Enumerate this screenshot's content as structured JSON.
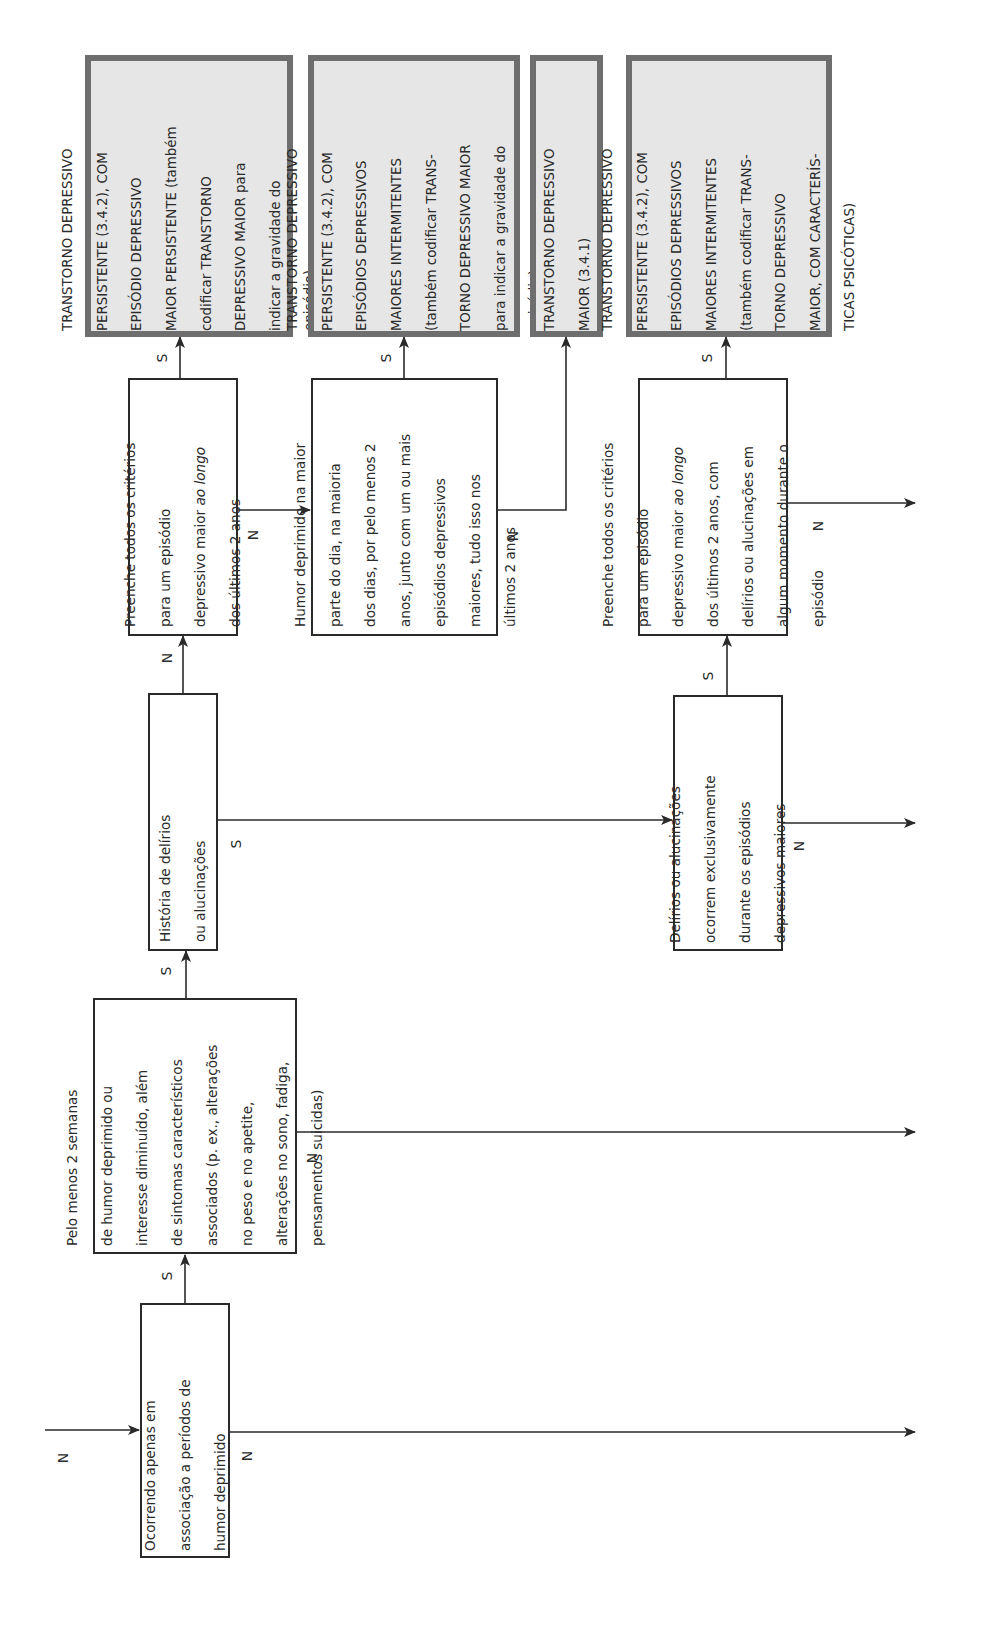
{
  "diagram": {
    "type": "decision-tree",
    "orientation": "rotated-90-ccw",
    "decision_nodes": [
      {
        "id": "n1",
        "lines": [
          "Ocorrendo apenas em",
          "associação a períodos de",
          "humor deprimido"
        ]
      },
      {
        "id": "n2",
        "lines": [
          "Pelo menos 2 semanas",
          "de humor deprimido ou",
          "interesse diminuído, além",
          "de sintomas característicos",
          "associados (p. ex., alterações",
          "no peso e no apetite,",
          "alterações no sono, fadiga,",
          "pensamentos suicidas)"
        ]
      },
      {
        "id": "n3",
        "lines": [
          "História de delírios",
          "ou alucinações"
        ]
      },
      {
        "id": "n4",
        "lines": [
          "Preenche todos os critérios",
          "para um episódio",
          "depressivo maior ao longo",
          "dos últimos 2 anos"
        ],
        "italic_phrase": "ao longo"
      },
      {
        "id": "n5",
        "lines": [
          "Humor deprimido na maior",
          "parte do dia, na maioria",
          "dos dias, por pelo menos 2",
          "anos, junto com um ou mais",
          "episódios depressivos",
          "maiores, tudo isso nos",
          "últimos 2 anos"
        ]
      },
      {
        "id": "n6",
        "lines": [
          "Delírios ou alucinações",
          "ocorrem exclusivamente",
          "durante os episódios",
          "depressivos maiores"
        ]
      },
      {
        "id": "n7",
        "lines": [
          "Preenche todos os critérios",
          "para um episódio",
          "depressivo maior ao longo",
          "dos últimos 2 anos, com",
          "delírios ou alucinações em",
          "algum momento durante o",
          "episódio"
        ],
        "italic_phrase": "ao longo"
      }
    ],
    "result_nodes": [
      {
        "id": "r1",
        "lines": [
          "TRANSTORNO DEPRESSIVO",
          "PERSISTENTE (3.4.2), COM",
          "EPISÓDIO DEPRESSIVO",
          "MAIOR PERSISTENTE (também",
          "codificar TRANSTORNO",
          "DEPRESSIVO MAIOR para",
          "indicar a gravidade do",
          "episódio)"
        ]
      },
      {
        "id": "r2",
        "lines": [
          "TRANSTORNO DEPRESSIVO",
          "PERSISTENTE (3.4.2), COM",
          "EPISÓDIOS DEPRESSIVOS",
          "MAIORES INTERMITENTES",
          "(também codificar TRANS-",
          "TORNO DEPRESSIVO MAIOR",
          "para indicar a gravidade do",
          "episódio)"
        ]
      },
      {
        "id": "r3",
        "lines": [
          "TRANSTORNO DEPRESSIVO",
          "MAIOR (3.4.1)"
        ]
      },
      {
        "id": "r4",
        "lines": [
          "TRANSTORNO DEPRESSIVO",
          "PERSISTENTE (3.4.2), COM",
          "EPISÓDIOS DEPRESSIVOS",
          "MAIORES INTERMITENTES",
          "(também codificar TRANS-",
          "TORNO DEPRESSIVO",
          "MAIOR, COM CARACTERÍS-",
          "TICAS PSICÓTICAS)"
        ]
      }
    ],
    "edge_labels": {
      "yes": "S",
      "no": "N"
    },
    "edges": [
      {
        "from": "entry",
        "to": "n1",
        "label": "N"
      },
      {
        "from": "n1",
        "to": "n2",
        "label": "S"
      },
      {
        "from": "n1",
        "to": "exit",
        "label": "N"
      },
      {
        "from": "n2",
        "to": "n3",
        "label": "S"
      },
      {
        "from": "n2",
        "to": "exit",
        "label": "N"
      },
      {
        "from": "n3",
        "to": "n4",
        "label": "N"
      },
      {
        "from": "n3",
        "to": "n6",
        "label": "S"
      },
      {
        "from": "n4",
        "to": "r1",
        "label": "S"
      },
      {
        "from": "n4",
        "to": "n5",
        "label": "N"
      },
      {
        "from": "n5",
        "to": "r2",
        "label": "S"
      },
      {
        "from": "n5",
        "to": "r3",
        "label": "N"
      },
      {
        "from": "n6",
        "to": "n7",
        "label": "S"
      },
      {
        "from": "n6",
        "to": "exit",
        "label": "N"
      },
      {
        "from": "n7",
        "to": "r4",
        "label": "S"
      },
      {
        "from": "n7",
        "to": "exit",
        "label": "N"
      }
    ],
    "colors": {
      "line": "#2a2a2a",
      "result_fill": "#e6e6e6",
      "result_border": "#6e6e6e"
    }
  }
}
